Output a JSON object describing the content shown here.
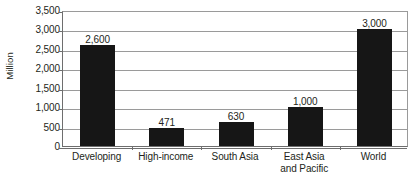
{
  "chart_data": {
    "type": "bar",
    "title": "",
    "subtitle": "",
    "xlabel": "",
    "ylabel": "Million",
    "ylim": [
      0,
      3500
    ],
    "ytick_step": 500,
    "ytick_labels": [
      "3,500",
      "3,000",
      "2,500",
      "2,000",
      "1,500",
      "1,000",
      "500",
      "0"
    ],
    "ytick_values": [
      3500,
      3000,
      2500,
      2000,
      1500,
      1000,
      500,
      0
    ],
    "grid": "horizontal",
    "legend": "none",
    "bar_color": "#161616",
    "gridline_color": "#9a9a9a",
    "axis_color": "#6e6e6e",
    "categories": [
      "Developing",
      "High-income",
      "South Asia",
      "East Asia and Pacific",
      "World"
    ],
    "category_lines": [
      [
        "Developing"
      ],
      [
        "High-income"
      ],
      [
        "South Asia"
      ],
      [
        "East Asia",
        "and Pacific"
      ],
      [
        "World"
      ]
    ],
    "values": [
      2600,
      471,
      630,
      1000,
      3000
    ],
    "value_labels": [
      "2,600",
      "471",
      "630",
      "1,000",
      "3,000"
    ]
  }
}
